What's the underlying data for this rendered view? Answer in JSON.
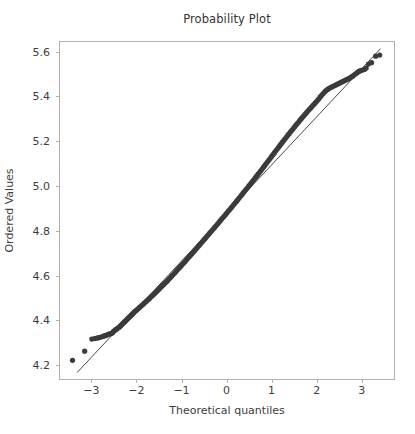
{
  "chart_data": {
    "type": "scatter",
    "title": "Probability Plot",
    "xlabel": "Theoretical quantiles",
    "ylabel": "Ordered Values",
    "xlim": [
      -3.72,
      3.74
    ],
    "ylim": [
      4.133,
      5.648
    ],
    "grid": false,
    "legend": null,
    "marker_color": "#3b3b3b",
    "line_color": "#333333",
    "frame_color": "#b0b0b0",
    "background_color": "#ffffff",
    "xticks": [
      -3,
      -2,
      -1,
      0,
      1,
      2,
      3
    ],
    "xtick_labels": [
      "−3",
      "−2",
      "−1",
      "0",
      "1",
      "2",
      "3"
    ],
    "yticks": [
      4.2,
      4.4,
      4.6,
      4.8,
      5.0,
      5.2,
      5.4,
      5.6
    ],
    "ytick_labels": [
      "4.2",
      "4.4",
      "4.6",
      "4.8",
      "5.0",
      "5.2",
      "5.4",
      "5.6"
    ],
    "fit_line": {
      "slope": 0.2148,
      "intercept": 4.8795,
      "x_start": -3.32,
      "x_end": 3.42,
      "y_start": 4.166,
      "y_end": 5.614
    },
    "series": [
      {
        "name": "ordered values",
        "points": [
          [
            -3.42,
            4.221
          ],
          [
            -3.15,
            4.262
          ],
          [
            -2.99,
            4.316
          ],
          [
            -2.93,
            4.318
          ],
          [
            -2.88,
            4.32
          ],
          [
            -2.84,
            4.322
          ],
          [
            -2.8,
            4.324
          ],
          [
            -2.76,
            4.327
          ],
          [
            -2.73,
            4.329
          ],
          [
            -2.7,
            4.331
          ],
          [
            -2.67,
            4.333
          ],
          [
            -2.64,
            4.336
          ],
          [
            -2.61,
            4.338
          ],
          [
            -2.58,
            4.34
          ],
          [
            -2.56,
            4.342
          ],
          [
            -2.53,
            4.344
          ],
          [
            -2.51,
            4.35
          ],
          [
            -2.48,
            4.355
          ],
          [
            -2.46,
            4.358
          ],
          [
            -2.44,
            4.361
          ],
          [
            -2.42,
            4.364
          ],
          [
            -2.39,
            4.368
          ],
          [
            -2.37,
            4.372
          ],
          [
            -2.35,
            4.376
          ],
          [
            -2.33,
            4.38
          ],
          [
            -2.31,
            4.384
          ],
          [
            -2.29,
            4.388
          ],
          [
            -2.27,
            4.392
          ],
          [
            -2.25,
            4.396
          ],
          [
            -2.23,
            4.4
          ],
          [
            -2.21,
            4.404
          ],
          [
            -2.19,
            4.408
          ],
          [
            -2.17,
            4.412
          ],
          [
            -2.15,
            4.416
          ],
          [
            -2.13,
            4.42
          ],
          [
            -2.11,
            4.424
          ],
          [
            -2.09,
            4.428
          ],
          [
            -2.07,
            4.432
          ],
          [
            -2.05,
            4.436
          ],
          [
            -2.03,
            4.44
          ],
          [
            -2.0,
            4.445
          ],
          [
            -1.97,
            4.45
          ],
          [
            -1.94,
            4.456
          ],
          [
            -1.91,
            4.461
          ],
          [
            -1.88,
            4.467
          ],
          [
            -1.85,
            4.472
          ],
          [
            -1.82,
            4.478
          ],
          [
            -1.79,
            4.483
          ],
          [
            -1.76,
            4.489
          ],
          [
            -1.73,
            4.494
          ],
          [
            -1.7,
            4.5
          ],
          [
            -1.67,
            4.506
          ],
          [
            -1.64,
            4.511
          ],
          [
            -1.61,
            4.517
          ],
          [
            -1.58,
            4.523
          ],
          [
            -1.55,
            4.529
          ],
          [
            -1.52,
            4.535
          ],
          [
            -1.49,
            4.541
          ],
          [
            -1.46,
            4.547
          ],
          [
            -1.43,
            4.553
          ],
          [
            -1.4,
            4.559
          ],
          [
            -1.37,
            4.565
          ],
          [
            -1.34,
            4.571
          ],
          [
            -1.31,
            4.577
          ],
          [
            -1.28,
            4.584
          ],
          [
            -1.25,
            4.59
          ],
          [
            -1.22,
            4.597
          ],
          [
            -1.19,
            4.603
          ],
          [
            -1.16,
            4.61
          ],
          [
            -1.13,
            4.616
          ],
          [
            -1.1,
            4.623
          ],
          [
            -1.07,
            4.63
          ],
          [
            -1.04,
            4.636
          ],
          [
            -1.01,
            4.643
          ],
          [
            -0.98,
            4.65
          ],
          [
            -0.95,
            4.656
          ],
          [
            -0.92,
            4.663
          ],
          [
            -0.89,
            4.67
          ],
          [
            -0.86,
            4.677
          ],
          [
            -0.83,
            4.684
          ],
          [
            -0.8,
            4.69
          ],
          [
            -0.77,
            4.697
          ],
          [
            -0.74,
            4.704
          ],
          [
            -0.71,
            4.711
          ],
          [
            -0.68,
            4.718
          ],
          [
            -0.65,
            4.725
          ],
          [
            -0.62,
            4.732
          ],
          [
            -0.59,
            4.739
          ],
          [
            -0.56,
            4.746
          ],
          [
            -0.53,
            4.753
          ],
          [
            -0.5,
            4.76
          ],
          [
            -0.47,
            4.767
          ],
          [
            -0.44,
            4.774
          ],
          [
            -0.41,
            4.781
          ],
          [
            -0.38,
            4.788
          ],
          [
            -0.35,
            4.795
          ],
          [
            -0.32,
            4.802
          ],
          [
            -0.29,
            4.809
          ],
          [
            -0.26,
            4.816
          ],
          [
            -0.23,
            4.823
          ],
          [
            -0.2,
            4.83
          ],
          [
            -0.17,
            4.837
          ],
          [
            -0.14,
            4.845
          ],
          [
            -0.11,
            4.852
          ],
          [
            -0.08,
            4.859
          ],
          [
            -0.05,
            4.866
          ],
          [
            -0.02,
            4.873
          ],
          [
            0.01,
            4.88
          ],
          [
            0.04,
            4.888
          ],
          [
            0.07,
            4.895
          ],
          [
            0.1,
            4.902
          ],
          [
            0.13,
            4.909
          ],
          [
            0.16,
            4.917
          ],
          [
            0.19,
            4.924
          ],
          [
            0.22,
            4.931
          ],
          [
            0.25,
            4.939
          ],
          [
            0.28,
            4.946
          ],
          [
            0.31,
            4.954
          ],
          [
            0.34,
            4.961
          ],
          [
            0.37,
            4.969
          ],
          [
            0.4,
            4.976
          ],
          [
            0.43,
            4.984
          ],
          [
            0.46,
            4.991
          ],
          [
            0.49,
            4.999
          ],
          [
            0.52,
            5.006
          ],
          [
            0.55,
            5.014
          ],
          [
            0.58,
            5.022
          ],
          [
            0.61,
            5.029
          ],
          [
            0.64,
            5.037
          ],
          [
            0.67,
            5.045
          ],
          [
            0.7,
            5.053
          ],
          [
            0.73,
            5.06
          ],
          [
            0.76,
            5.068
          ],
          [
            0.79,
            5.076
          ],
          [
            0.82,
            5.084
          ],
          [
            0.85,
            5.092
          ],
          [
            0.88,
            5.1
          ],
          [
            0.91,
            5.108
          ],
          [
            0.94,
            5.116
          ],
          [
            0.97,
            5.124
          ],
          [
            1.0,
            5.132
          ],
          [
            1.03,
            5.14
          ],
          [
            1.06,
            5.148
          ],
          [
            1.09,
            5.156
          ],
          [
            1.12,
            5.164
          ],
          [
            1.15,
            5.172
          ],
          [
            1.18,
            5.18
          ],
          [
            1.21,
            5.188
          ],
          [
            1.24,
            5.196
          ],
          [
            1.27,
            5.203
          ],
          [
            1.3,
            5.211
          ],
          [
            1.33,
            5.219
          ],
          [
            1.36,
            5.227
          ],
          [
            1.39,
            5.234
          ],
          [
            1.42,
            5.242
          ],
          [
            1.45,
            5.249
          ],
          [
            1.48,
            5.257
          ],
          [
            1.51,
            5.264
          ],
          [
            1.54,
            5.272
          ],
          [
            1.57,
            5.279
          ],
          [
            1.6,
            5.286
          ],
          [
            1.63,
            5.294
          ],
          [
            1.66,
            5.301
          ],
          [
            1.69,
            5.308
          ],
          [
            1.72,
            5.315
          ],
          [
            1.75,
            5.322
          ],
          [
            1.78,
            5.329
          ],
          [
            1.81,
            5.336
          ],
          [
            1.84,
            5.343
          ],
          [
            1.87,
            5.349
          ],
          [
            1.9,
            5.356
          ],
          [
            1.93,
            5.363
          ],
          [
            1.96,
            5.369
          ],
          [
            1.99,
            5.376
          ],
          [
            2.02,
            5.383
          ],
          [
            2.05,
            5.39
          ],
          [
            2.08,
            5.398
          ],
          [
            2.11,
            5.405
          ],
          [
            2.14,
            5.412
          ],
          [
            2.17,
            5.419
          ],
          [
            2.2,
            5.425
          ],
          [
            2.23,
            5.43
          ],
          [
            2.26,
            5.434
          ],
          [
            2.29,
            5.438
          ],
          [
            2.32,
            5.441
          ],
          [
            2.35,
            5.444
          ],
          [
            2.38,
            5.447
          ],
          [
            2.41,
            5.45
          ],
          [
            2.44,
            5.453
          ],
          [
            2.47,
            5.456
          ],
          [
            2.5,
            5.459
          ],
          [
            2.53,
            5.462
          ],
          [
            2.56,
            5.465
          ],
          [
            2.59,
            5.468
          ],
          [
            2.62,
            5.471
          ],
          [
            2.65,
            5.474
          ],
          [
            2.68,
            5.477
          ],
          [
            2.71,
            5.48
          ],
          [
            2.74,
            5.483
          ],
          [
            2.77,
            5.487
          ],
          [
            2.8,
            5.491
          ],
          [
            2.83,
            5.496
          ],
          [
            2.86,
            5.5
          ],
          [
            2.89,
            5.505
          ],
          [
            2.92,
            5.51
          ],
          [
            2.95,
            5.513
          ],
          [
            2.98,
            5.516
          ],
          [
            3.02,
            5.518
          ],
          [
            3.06,
            5.521
          ],
          [
            3.1,
            5.527
          ],
          [
            3.15,
            5.545
          ],
          [
            3.22,
            5.551
          ],
          [
            3.31,
            5.58
          ],
          [
            3.4,
            5.585
          ]
        ]
      }
    ]
  },
  "figure": {
    "title": "Probability Plot",
    "xlabel": "Theoretical quantiles",
    "ylabel": "Ordered Values"
  }
}
